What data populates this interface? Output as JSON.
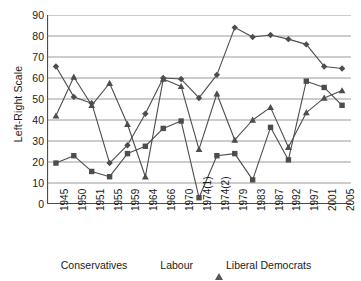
{
  "chart_data": {
    "type": "line",
    "title": "",
    "xlabel": "",
    "ylabel": "Left-Right Scale",
    "ylim": [
      0,
      90
    ],
    "ytick_step": 10,
    "yticks": [
      90,
      80,
      70,
      60,
      50,
      40,
      30,
      20,
      10,
      0
    ],
    "grid": true,
    "legend_position": "bottom",
    "categories": [
      "1945",
      "1950",
      "1951",
      "1955",
      "1959",
      "1964",
      "1966",
      "1970",
      "1974(1)",
      "1974(2)",
      "1979",
      "1983",
      "1987",
      "1992",
      "1997",
      "2001",
      "2005"
    ],
    "series": [
      {
        "name": "Conservatives",
        "marker": "diamond",
        "color": "#4d4d4d",
        "values": [
          65.5,
          51,
          48,
          19.5,
          28,
          43,
          60,
          59.5,
          50.5,
          61.5,
          84,
          79.5,
          80.5,
          78.5,
          76,
          65.5,
          64.5
        ]
      },
      {
        "name": "Labour",
        "marker": "square",
        "color": "#4d4d4d",
        "values": [
          19.5,
          23,
          15.5,
          13,
          24,
          27.5,
          36,
          39.5,
          3,
          23,
          24,
          11.5,
          36.5,
          21,
          58.5,
          55.5,
          47
        ]
      },
      {
        "name": "Liberal Democrats",
        "marker": "triangle",
        "color": "#4d4d4d",
        "values": [
          42,
          60.5,
          47,
          57.5,
          38,
          13,
          59.5,
          56,
          26,
          52.5,
          30.5,
          40,
          46,
          27,
          43.5,
          50.5,
          54
        ]
      }
    ]
  },
  "legend": {
    "entries": [
      {
        "label": "Conservatives",
        "marker": "diamond-marker"
      },
      {
        "label": "Labour",
        "marker": "square-marker"
      },
      {
        "label": "Liberal Democrats",
        "marker": "triangle-marker"
      }
    ]
  },
  "axis": {
    "y_title": "Left-Right Scale"
  },
  "colors": {
    "series": "#4d4d4d",
    "grid": "#9a9a9a",
    "axis": "#4d4d4d",
    "text": "#1a1a1a",
    "background": "#ffffff"
  }
}
